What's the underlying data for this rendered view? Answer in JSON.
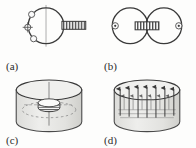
{
  "figure": {
    "background_color": "#fdfdfc",
    "ink_color": "#3a3a3a",
    "fill_light": "#e9e9e7",
    "fill_mid": "#d8d8d5",
    "hatch_color": "#4a4a4a",
    "panels": [
      {
        "id": "a",
        "label": "(a)",
        "description": "circle with hatched bar tangent at right side and small circular markers on left arc",
        "shapes": {
          "circle_cx": 46,
          "circle_cy": 26,
          "circle_r": 18,
          "bar_x": 62,
          "bar_y": 21,
          "bar_w": 24,
          "bar_h": 8,
          "bar_hatch_count": 8,
          "markers": [
            {
              "cx": 31,
              "cy": 14,
              "r": 3
            },
            {
              "cx": 27,
              "cy": 27,
              "r": 3
            },
            {
              "cx": 33,
              "cy": 39,
              "r": 3
            }
          ],
          "axis_x": 46,
          "axis_y1": 6,
          "axis_y2": 46
        }
      },
      {
        "id": "b",
        "label": "(b)",
        "description": "two tangent circles with central hatched bar and dotted circle markers at both outer centers",
        "shapes": {
          "left_cx": 32,
          "left_cy": 26,
          "right_cx": 66,
          "right_cy": 26,
          "circle_r": 18,
          "bar_x": 37,
          "bar_y": 22,
          "bar_w": 24,
          "bar_h": 8,
          "bar_hatch_count": 8,
          "markers": [
            {
              "cx": 17,
              "cy": 26,
              "r": 3
            },
            {
              "cx": 81,
              "cy": 26,
              "r": 3
            }
          ]
        }
      },
      {
        "id": "c",
        "label": "(c)",
        "description": "3D cylinder containing a small hatched disc on the central axis with dashed interior ellipse",
        "shapes": {
          "cyl_cx": 49,
          "cyl_top_cy": 16,
          "cyl_rx": 33,
          "cyl_ry": 10,
          "cyl_height": 38,
          "disc_cx": 49,
          "disc_cy": 32,
          "disc_rx": 11,
          "disc_ry": 4,
          "disc_hatch_count": 9,
          "dashed_rx": 26,
          "dashed_ry": 8,
          "dashed_cy": 36,
          "axis_x": 49,
          "axis_y1": 10,
          "axis_y2": 52
        }
      },
      {
        "id": "d",
        "label": "(d)",
        "description": "3D cylinder with an array of upward pointing arrows arranged on an interior plane",
        "shapes": {
          "cyl_cx": 49,
          "cyl_top_cy": 16,
          "cyl_rx": 33,
          "cyl_ry": 10,
          "cyl_height": 38,
          "arrow_count": 7,
          "arrow_row_y_base": 40,
          "arrow_row_y_tip": 13,
          "arrow_spacing": 9,
          "arrow_back_row_count": 6,
          "plane_cy": 38,
          "plane_rx": 27,
          "plane_ry": 8
        }
      }
    ]
  }
}
